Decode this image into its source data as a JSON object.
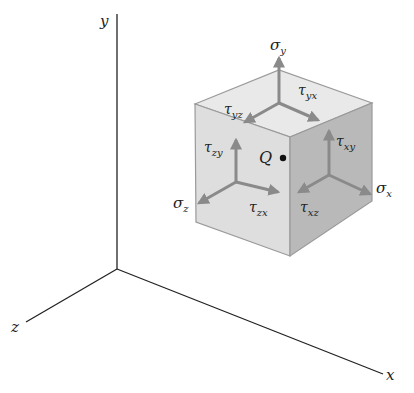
{
  "figure": {
    "axes": {
      "x_label": "x",
      "y_label": "y",
      "z_label": "z"
    },
    "point": {
      "label": "Q"
    },
    "stresses": {
      "top_face": {
        "normal": {
          "symbol": "σ",
          "sub": "y"
        },
        "shear_1": {
          "symbol": "τ",
          "sub": "yx"
        },
        "shear_2": {
          "symbol": "τ",
          "sub": "yz"
        }
      },
      "front_face": {
        "normal": {
          "symbol": "σ",
          "sub": "z"
        },
        "shear_1": {
          "symbol": "τ",
          "sub": "zy"
        },
        "shear_2": {
          "symbol": "τ",
          "sub": "zx"
        }
      },
      "right_face": {
        "normal": {
          "symbol": "σ",
          "sub": "x"
        },
        "shear_1": {
          "symbol": "τ",
          "sub": "xy"
        },
        "shear_2": {
          "symbol": "τ",
          "sub": "xz"
        }
      }
    },
    "colors": {
      "axis": "#222222",
      "cube_top": "#e9e9e9",
      "cube_front": "#dedede",
      "cube_right": "#b9b9b9",
      "arrow": "#8a8a8a"
    }
  }
}
